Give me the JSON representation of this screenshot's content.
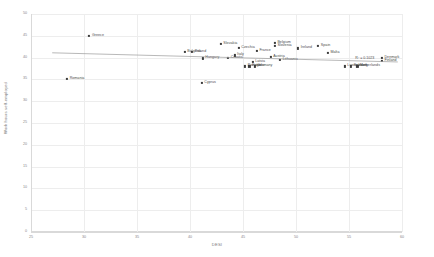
{
  "chart_data": {
    "type": "scatter",
    "title": "",
    "xlabel": "DESI",
    "ylabel": "Work hours self-employed",
    "xlim": [
      25,
      60
    ],
    "ylim": [
      0,
      50
    ],
    "xticks": [
      25,
      30,
      35,
      40,
      45,
      50,
      55,
      60
    ],
    "yticks": [
      0,
      5,
      10,
      15,
      20,
      25,
      30,
      35,
      40,
      45,
      50
    ],
    "grid": true,
    "legend": "none",
    "annotations": [
      {
        "text": "R² = 0.1023",
        "x": 55.6,
        "y": 39.6
      }
    ],
    "trendline": {
      "type": "linear",
      "r_squared": 0.1023,
      "x_start": 27.0,
      "y_start": 41.1,
      "x_end": 59.6,
      "y_end": 39.0
    },
    "points": [
      {
        "label": "Greece",
        "x": 30.5,
        "y": 45.0
      },
      {
        "label": "Romania",
        "x": 28.4,
        "y": 35.1
      },
      {
        "label": "Bulgaria",
        "x": 39.5,
        "y": 41.3
      },
      {
        "label": "Poland",
        "x": 40.2,
        "y": 41.3
      },
      {
        "label": "Hungary",
        "x": 41.2,
        "y": 39.8
      },
      {
        "label": "Cyprus",
        "x": 41.1,
        "y": 34.2
      },
      {
        "label": "Slovakia",
        "x": 42.9,
        "y": 43.1
      },
      {
        "label": "Croatia",
        "x": 43.6,
        "y": 39.9
      },
      {
        "label": "Italy",
        "x": 44.2,
        "y": 40.5
      },
      {
        "label": "Czechia",
        "x": 44.6,
        "y": 42.2
      },
      {
        "label": "Portugal",
        "x": 45.2,
        "y": 38.0
      },
      {
        "label": "Estonia",
        "x": 45.6,
        "y": 38.0
      },
      {
        "label": "Germany",
        "x": 46.1,
        "y": 38.0
      },
      {
        "label": "Latvia",
        "x": 45.9,
        "y": 39.0
      },
      {
        "label": "France",
        "x": 46.3,
        "y": 41.5
      },
      {
        "label": "Austria",
        "x": 47.6,
        "y": 40.1
      },
      {
        "label": "Belgium",
        "x": 48.0,
        "y": 43.3
      },
      {
        "label": "Slovenia",
        "x": 48.0,
        "y": 42.6
      },
      {
        "label": "Lithuania",
        "x": 48.5,
        "y": 39.5
      },
      {
        "label": "Ireland",
        "x": 50.2,
        "y": 42.1
      },
      {
        "label": "Spain",
        "x": 52.1,
        "y": 42.6
      },
      {
        "label": "Malta",
        "x": 53.0,
        "y": 41.0
      },
      {
        "label": "Luxembourg",
        "x": 54.6,
        "y": 38.0
      },
      {
        "label": "Sweden",
        "x": 55.2,
        "y": 38.0
      },
      {
        "label": "Netherlands",
        "x": 55.8,
        "y": 38.0
      },
      {
        "label": "Denmark",
        "x": 58.1,
        "y": 39.9
      },
      {
        "label": "Finland",
        "x": 58.1,
        "y": 39.3
      }
    ],
    "colors": {
      "marker": "#3b3b3b",
      "trendline": "#9a9a9a",
      "grid": "#ededed",
      "axis": "#d9d9d9",
      "text": "#4a4a4a",
      "tick_text": "#888888",
      "background": "#ffffff"
    }
  }
}
